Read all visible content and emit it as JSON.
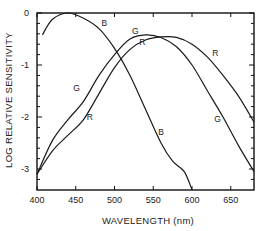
{
  "chart_data": {
    "type": "line",
    "title": "",
    "xlabel": "WAVELENGTH (nm)",
    "ylabel": "LOG RELATIVE SENSITIVITY",
    "xlim": [
      400,
      680
    ],
    "ylim": [
      -3.4,
      0
    ],
    "x_ticks": [
      400,
      450,
      500,
      550,
      600,
      650
    ],
    "x_tick_labels": [
      "400",
      "450",
      "500",
      "550",
      "600",
      "650"
    ],
    "y_ticks": [
      0,
      -1,
      -2,
      -3
    ],
    "y_tick_labels": [
      "0",
      "-1",
      "-2",
      "-3"
    ],
    "grid": false,
    "legend": "inline curve labels",
    "series": [
      {
        "name": "B",
        "x": [
          407,
          420,
          440,
          460,
          480,
          500,
          520,
          540,
          560,
          575,
          590,
          600
        ],
        "y": [
          -0.42,
          -0.12,
          0.0,
          -0.1,
          -0.3,
          -0.68,
          -1.2,
          -1.85,
          -2.5,
          -2.85,
          -3.05,
          -3.4
        ]
      },
      {
        "name": "G",
        "x": [
          400,
          420,
          440,
          460,
          480,
          500,
          520,
          540,
          560,
          580,
          600,
          620,
          640,
          660,
          680
        ],
        "y": [
          -3.1,
          -2.45,
          -2.05,
          -1.7,
          -1.2,
          -0.8,
          -0.5,
          -0.42,
          -0.47,
          -0.65,
          -1.0,
          -1.5,
          -2.0,
          -2.55,
          -3.05
        ]
      },
      {
        "name": "R",
        "x": [
          400,
          420,
          440,
          460,
          480,
          500,
          520,
          540,
          560,
          580,
          600,
          620,
          640,
          660,
          680
        ],
        "y": [
          -3.1,
          -2.65,
          -2.35,
          -2.05,
          -1.55,
          -1.05,
          -0.7,
          -0.52,
          -0.46,
          -0.47,
          -0.6,
          -0.85,
          -1.2,
          -1.6,
          -2.1
        ]
      }
    ],
    "annotations": [
      {
        "text": "B",
        "x": 487,
        "y": -0.25
      },
      {
        "text": "G",
        "x": 527,
        "y": -0.4
      },
      {
        "text": "R",
        "x": 536,
        "y": -0.62
      },
      {
        "text": "R",
        "x": 630,
        "y": -0.82
      },
      {
        "text": "G",
        "x": 633,
        "y": -2.1
      },
      {
        "text": "G",
        "x": 451,
        "y": -1.5
      },
      {
        "text": "R",
        "x": 468,
        "y": -2.05
      },
      {
        "text": "B",
        "x": 560,
        "y": -2.35
      }
    ]
  }
}
